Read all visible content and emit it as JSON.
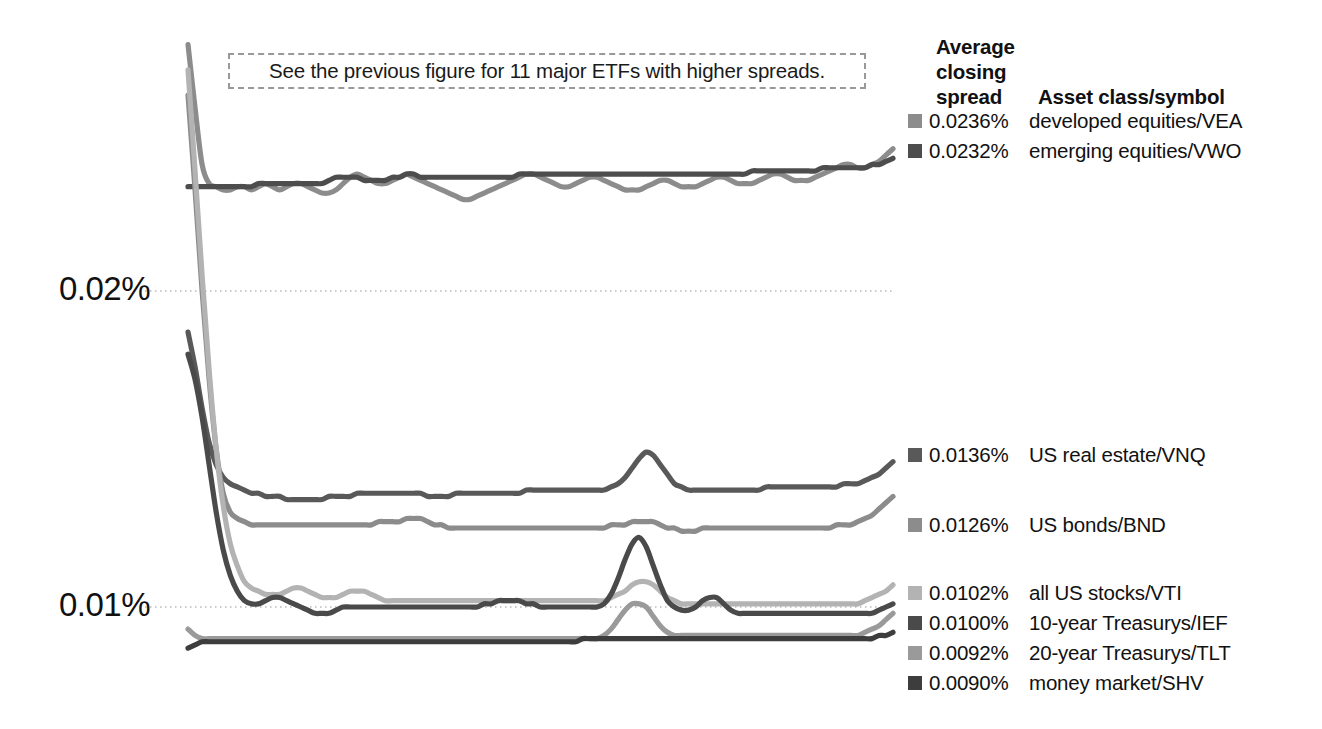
{
  "annotation": {
    "text": "See the previous figure for 11 major ETFs with higher spreads."
  },
  "legend": {
    "header_line1": "Average",
    "header_line2": "closing",
    "header_line3": "spread",
    "header_col2": "Asset class/symbol"
  },
  "chart_data": {
    "type": "line",
    "title": "",
    "xlabel": "",
    "ylabel": "",
    "grid": true,
    "gridlines": [
      0.02,
      0.01
    ],
    "ytick_labels": [
      "0.02%",
      "0.01%"
    ],
    "ylim": [
      0.0075,
      0.0285
    ],
    "xlim": [
      0,
      100
    ],
    "legend_position": "right",
    "series": [
      {
        "name": "developed equities/VEA",
        "symbol": "VEA",
        "asset_class": "developed equities",
        "average_closing_spread": "0.0236%",
        "value": 0.0236,
        "color": "#8c8c8c",
        "legend_top": 108,
        "values": [
          0.0278,
          0.0258,
          0.024,
          0.0234,
          0.0233,
          0.0232,
          0.0232,
          0.0233,
          0.0233,
          0.0232,
          0.0233,
          0.0234,
          0.0233,
          0.0232,
          0.0233,
          0.0234,
          0.0234,
          0.0233,
          0.0232,
          0.0231,
          0.0231,
          0.0232,
          0.0234,
          0.0236,
          0.0237,
          0.0236,
          0.0235,
          0.0234,
          0.0234,
          0.0235,
          0.0236,
          0.0237,
          0.0236,
          0.0235,
          0.0234,
          0.0233,
          0.0232,
          0.0231,
          0.023,
          0.0229,
          0.0229,
          0.023,
          0.0231,
          0.0232,
          0.0233,
          0.0234,
          0.0235,
          0.0236,
          0.0237,
          0.0237,
          0.0236,
          0.0235,
          0.0234,
          0.0233,
          0.0233,
          0.0234,
          0.0235,
          0.0236,
          0.0236,
          0.0235,
          0.0234,
          0.0233,
          0.0232,
          0.0232,
          0.0232,
          0.0233,
          0.0234,
          0.0235,
          0.0235,
          0.0234,
          0.0233,
          0.0233,
          0.0233,
          0.0234,
          0.0235,
          0.0236,
          0.0236,
          0.0235,
          0.0234,
          0.0234,
          0.0234,
          0.0235,
          0.0236,
          0.0237,
          0.0237,
          0.0236,
          0.0235,
          0.0235,
          0.0235,
          0.0236,
          0.0237,
          0.0238,
          0.0239,
          0.024,
          0.024,
          0.0239,
          0.0239,
          0.024,
          0.0241,
          0.0243,
          0.0245
        ]
      },
      {
        "name": "emerging equities/VWO",
        "symbol": "VWO",
        "asset_class": "emerging equities",
        "average_closing_spread": "0.0232%",
        "value": 0.0232,
        "color": "#4d4d4d",
        "legend_top": 138,
        "values": [
          0.0233,
          0.0233,
          0.0233,
          0.0233,
          0.0233,
          0.0233,
          0.0233,
          0.0233,
          0.0233,
          0.0233,
          0.0234,
          0.0234,
          0.0234,
          0.0234,
          0.0234,
          0.0234,
          0.0234,
          0.0234,
          0.0234,
          0.0234,
          0.0235,
          0.0236,
          0.0236,
          0.0236,
          0.0236,
          0.0235,
          0.0235,
          0.0235,
          0.0235,
          0.0236,
          0.0236,
          0.0237,
          0.0237,
          0.0236,
          0.0236,
          0.0236,
          0.0236,
          0.0236,
          0.0236,
          0.0236,
          0.0236,
          0.0236,
          0.0236,
          0.0236,
          0.0236,
          0.0236,
          0.0236,
          0.0237,
          0.0237,
          0.0237,
          0.0237,
          0.0237,
          0.0237,
          0.0237,
          0.0237,
          0.0237,
          0.0237,
          0.0237,
          0.0237,
          0.0237,
          0.0237,
          0.0237,
          0.0237,
          0.0237,
          0.0237,
          0.0237,
          0.0237,
          0.0237,
          0.0237,
          0.0237,
          0.0237,
          0.0237,
          0.0237,
          0.0237,
          0.0237,
          0.0237,
          0.0237,
          0.0237,
          0.0237,
          0.0237,
          0.0238,
          0.0238,
          0.0238,
          0.0238,
          0.0238,
          0.0238,
          0.0238,
          0.0238,
          0.0238,
          0.0238,
          0.0239,
          0.0239,
          0.0239,
          0.0239,
          0.0239,
          0.0239,
          0.0239,
          0.024,
          0.024,
          0.0241,
          0.0242
        ]
      },
      {
        "name": "US real estate/VNQ",
        "symbol": "VNQ",
        "asset_class": "US real estate",
        "average_closing_spread": "0.0136%",
        "value": 0.0136,
        "color": "#595959",
        "legend_top": 442,
        "values": [
          0.0187,
          0.0176,
          0.0163,
          0.0152,
          0.0145,
          0.0141,
          0.0139,
          0.0138,
          0.0137,
          0.0136,
          0.0136,
          0.0135,
          0.0135,
          0.0135,
          0.0134,
          0.0134,
          0.0134,
          0.0134,
          0.0134,
          0.0134,
          0.0135,
          0.0135,
          0.0135,
          0.0135,
          0.0136,
          0.0136,
          0.0136,
          0.0136,
          0.0136,
          0.0136,
          0.0136,
          0.0136,
          0.0136,
          0.0136,
          0.0135,
          0.0135,
          0.0135,
          0.0135,
          0.0136,
          0.0136,
          0.0136,
          0.0136,
          0.0136,
          0.0136,
          0.0136,
          0.0136,
          0.0136,
          0.0136,
          0.0137,
          0.0137,
          0.0137,
          0.0137,
          0.0137,
          0.0137,
          0.0137,
          0.0137,
          0.0137,
          0.0137,
          0.0137,
          0.0137,
          0.0138,
          0.0139,
          0.0141,
          0.0144,
          0.0147,
          0.0149,
          0.0148,
          0.0145,
          0.0142,
          0.0139,
          0.0138,
          0.0137,
          0.0137,
          0.0137,
          0.0137,
          0.0137,
          0.0137,
          0.0137,
          0.0137,
          0.0137,
          0.0137,
          0.0137,
          0.0138,
          0.0138,
          0.0138,
          0.0138,
          0.0138,
          0.0138,
          0.0138,
          0.0138,
          0.0138,
          0.0138,
          0.0138,
          0.0139,
          0.0139,
          0.0139,
          0.014,
          0.0141,
          0.0142,
          0.0144,
          0.0146
        ]
      },
      {
        "name": "US bonds/BND",
        "symbol": "BND",
        "asset_class": "US bonds",
        "average_closing_spread": "0.0126%",
        "value": 0.0126,
        "color": "#8c8c8c",
        "legend_top": 512,
        "values": [
          0.0262,
          0.0232,
          0.02,
          0.0172,
          0.015,
          0.0136,
          0.013,
          0.0128,
          0.0127,
          0.0126,
          0.0126,
          0.0126,
          0.0126,
          0.0126,
          0.0126,
          0.0126,
          0.0126,
          0.0126,
          0.0126,
          0.0126,
          0.0126,
          0.0126,
          0.0126,
          0.0126,
          0.0126,
          0.0126,
          0.0126,
          0.0127,
          0.0127,
          0.0127,
          0.0127,
          0.0128,
          0.0128,
          0.0128,
          0.0127,
          0.0126,
          0.0126,
          0.0125,
          0.0125,
          0.0125,
          0.0125,
          0.0125,
          0.0125,
          0.0125,
          0.0125,
          0.0125,
          0.0125,
          0.0125,
          0.0125,
          0.0125,
          0.0125,
          0.0125,
          0.0125,
          0.0125,
          0.0125,
          0.0125,
          0.0125,
          0.0125,
          0.0125,
          0.0125,
          0.0126,
          0.0126,
          0.0126,
          0.0127,
          0.0127,
          0.0127,
          0.0127,
          0.0126,
          0.0125,
          0.0125,
          0.0124,
          0.0124,
          0.0124,
          0.0125,
          0.0125,
          0.0125,
          0.0125,
          0.0125,
          0.0125,
          0.0125,
          0.0125,
          0.0125,
          0.0125,
          0.0125,
          0.0125,
          0.0125,
          0.0125,
          0.0125,
          0.0125,
          0.0125,
          0.0125,
          0.0125,
          0.0126,
          0.0126,
          0.0126,
          0.0127,
          0.0128,
          0.0129,
          0.0131,
          0.0133,
          0.0135
        ]
      },
      {
        "name": "all US stocks/VTI",
        "symbol": "VTI",
        "asset_class": "all US stocks",
        "average_closing_spread": "0.0102%",
        "value": 0.0102,
        "color": "#b3b3b3",
        "legend_top": 580,
        "values": [
          0.027,
          0.0238,
          0.0205,
          0.0175,
          0.015,
          0.0132,
          0.012,
          0.0113,
          0.0108,
          0.0106,
          0.0105,
          0.0104,
          0.0104,
          0.0104,
          0.0105,
          0.0106,
          0.0106,
          0.0105,
          0.0104,
          0.0103,
          0.0103,
          0.0103,
          0.0104,
          0.0105,
          0.0105,
          0.0105,
          0.0104,
          0.0103,
          0.0102,
          0.0102,
          0.0102,
          0.0102,
          0.0102,
          0.0102,
          0.0102,
          0.0102,
          0.0102,
          0.0102,
          0.0102,
          0.0102,
          0.0102,
          0.0102,
          0.0102,
          0.0102,
          0.0102,
          0.0102,
          0.0102,
          0.0102,
          0.0102,
          0.0102,
          0.0102,
          0.0102,
          0.0102,
          0.0102,
          0.0102,
          0.0102,
          0.0102,
          0.0102,
          0.0102,
          0.0102,
          0.0103,
          0.0104,
          0.0105,
          0.0107,
          0.0108,
          0.0108,
          0.0107,
          0.0105,
          0.0103,
          0.0102,
          0.0101,
          0.0101,
          0.0101,
          0.0101,
          0.0101,
          0.0101,
          0.0101,
          0.0101,
          0.0101,
          0.0101,
          0.0101,
          0.0101,
          0.0101,
          0.0101,
          0.0101,
          0.0101,
          0.0101,
          0.0101,
          0.0101,
          0.0101,
          0.0101,
          0.0101,
          0.0101,
          0.0101,
          0.0101,
          0.0101,
          0.0102,
          0.0103,
          0.0104,
          0.0105,
          0.0107
        ]
      },
      {
        "name": "10-year Treasurys/IEF",
        "symbol": "IEF",
        "asset_class": "10-year Treasurys",
        "average_closing_spread": "0.0100%",
        "value": 0.01,
        "color": "#4a4a4a",
        "legend_top": 610,
        "values": [
          0.018,
          0.0172,
          0.016,
          0.0145,
          0.013,
          0.0118,
          0.011,
          0.0105,
          0.0102,
          0.0101,
          0.0101,
          0.0102,
          0.0103,
          0.0103,
          0.0102,
          0.0101,
          0.01,
          0.0099,
          0.0098,
          0.0098,
          0.0098,
          0.0099,
          0.01,
          0.01,
          0.01,
          0.01,
          0.01,
          0.01,
          0.01,
          0.01,
          0.01,
          0.01,
          0.01,
          0.01,
          0.01,
          0.01,
          0.01,
          0.01,
          0.01,
          0.01,
          0.01,
          0.01,
          0.0101,
          0.0101,
          0.0102,
          0.0102,
          0.0102,
          0.0102,
          0.0101,
          0.0101,
          0.01,
          0.01,
          0.01,
          0.01,
          0.01,
          0.01,
          0.01,
          0.01,
          0.01,
          0.0101,
          0.0104,
          0.0109,
          0.0115,
          0.012,
          0.0122,
          0.0119,
          0.0113,
          0.0107,
          0.0102,
          0.01,
          0.0099,
          0.0099,
          0.01,
          0.0102,
          0.0103,
          0.0103,
          0.0101,
          0.0099,
          0.0098,
          0.0098,
          0.0098,
          0.0098,
          0.0098,
          0.0098,
          0.0098,
          0.0098,
          0.0098,
          0.0098,
          0.0098,
          0.0098,
          0.0098,
          0.0098,
          0.0098,
          0.0098,
          0.0098,
          0.0098,
          0.0098,
          0.0098,
          0.0099,
          0.01,
          0.0101
        ]
      },
      {
        "name": "20-year Treasurys/TLT",
        "symbol": "TLT",
        "asset_class": "20-year Treasurys",
        "average_closing_spread": "0.0092%",
        "value": 0.0092,
        "color": "#9a9a9a",
        "legend_top": 640,
        "values": [
          0.0093,
          0.0091,
          0.009,
          0.009,
          0.009,
          0.009,
          0.009,
          0.009,
          0.009,
          0.009,
          0.009,
          0.009,
          0.009,
          0.009,
          0.009,
          0.009,
          0.009,
          0.009,
          0.009,
          0.009,
          0.009,
          0.009,
          0.009,
          0.009,
          0.009,
          0.009,
          0.009,
          0.009,
          0.009,
          0.009,
          0.009,
          0.009,
          0.009,
          0.009,
          0.009,
          0.009,
          0.009,
          0.009,
          0.009,
          0.009,
          0.009,
          0.009,
          0.009,
          0.009,
          0.009,
          0.009,
          0.009,
          0.009,
          0.009,
          0.009,
          0.009,
          0.009,
          0.009,
          0.009,
          0.009,
          0.009,
          0.009,
          0.009,
          0.009,
          0.0091,
          0.0093,
          0.0096,
          0.0099,
          0.0101,
          0.0101,
          0.01,
          0.0097,
          0.0094,
          0.0092,
          0.0091,
          0.0091,
          0.0091,
          0.0091,
          0.0091,
          0.0091,
          0.0091,
          0.0091,
          0.0091,
          0.0091,
          0.0091,
          0.0091,
          0.0091,
          0.0091,
          0.0091,
          0.0091,
          0.0091,
          0.0091,
          0.0091,
          0.0091,
          0.0091,
          0.0091,
          0.0091,
          0.0091,
          0.0091,
          0.0091,
          0.0091,
          0.0092,
          0.0093,
          0.0094,
          0.0096,
          0.0098
        ]
      },
      {
        "name": "money market/SHV",
        "symbol": "SHV",
        "asset_class": "money market",
        "average_closing_spread": "0.0090%",
        "value": 0.009,
        "color": "#3d3d3d",
        "legend_top": 670,
        "values": [
          0.0087,
          0.0088,
          0.0089,
          0.0089,
          0.0089,
          0.0089,
          0.0089,
          0.0089,
          0.0089,
          0.0089,
          0.0089,
          0.0089,
          0.0089,
          0.0089,
          0.0089,
          0.0089,
          0.0089,
          0.0089,
          0.0089,
          0.0089,
          0.0089,
          0.0089,
          0.0089,
          0.0089,
          0.0089,
          0.0089,
          0.0089,
          0.0089,
          0.0089,
          0.0089,
          0.0089,
          0.0089,
          0.0089,
          0.0089,
          0.0089,
          0.0089,
          0.0089,
          0.0089,
          0.0089,
          0.0089,
          0.0089,
          0.0089,
          0.0089,
          0.0089,
          0.0089,
          0.0089,
          0.0089,
          0.0089,
          0.0089,
          0.0089,
          0.0089,
          0.0089,
          0.0089,
          0.0089,
          0.0089,
          0.0089,
          0.009,
          0.009,
          0.009,
          0.009,
          0.009,
          0.009,
          0.009,
          0.009,
          0.009,
          0.009,
          0.009,
          0.009,
          0.009,
          0.009,
          0.009,
          0.009,
          0.009,
          0.009,
          0.009,
          0.009,
          0.009,
          0.009,
          0.009,
          0.009,
          0.009,
          0.009,
          0.009,
          0.009,
          0.009,
          0.009,
          0.009,
          0.009,
          0.009,
          0.009,
          0.009,
          0.009,
          0.009,
          0.009,
          0.009,
          0.009,
          0.009,
          0.009,
          0.0091,
          0.0091,
          0.0092
        ]
      }
    ]
  }
}
